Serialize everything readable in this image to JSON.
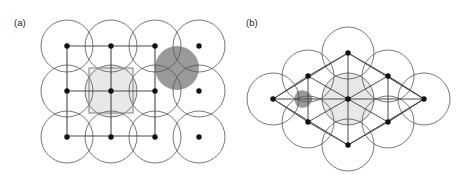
{
  "figure": {
    "width": 462,
    "height": 175,
    "background": "#ffffff"
  },
  "colors": {
    "background": "#ffffff",
    "circle_stroke": "#555555",
    "lattice_line": "#4a4a4a",
    "lattice_point": "#111111",
    "unit_cell_stroke": "#8a8a8a",
    "unit_cell_fill": "#ececec",
    "highlight_circle_fill": "#e8e8e8",
    "void_dark_fill": "#9a9a9a",
    "void_mid_fill": "#b0b0b0",
    "label_text": "#1a1a1a"
  },
  "panels": [
    {
      "id": "a",
      "label": "(a)",
      "label_x": 14,
      "label_y": 26,
      "lattice_type": "square",
      "circle_radius": 26,
      "packing_circle_radius": 26,
      "lattice_spacing_x": 44,
      "lattice_spacing_y": 45,
      "columns": 4,
      "rows": 3,
      "origin_x": 67,
      "origin_y": 46,
      "separated_column_index": 4,
      "separated_column_x": 199,
      "bond_columns": 3,
      "unit_cell": {
        "x": 89,
        "y": 68,
        "width": 44,
        "height": 45,
        "fill": "#ececec",
        "stroke": "#8a8a8a"
      },
      "highlight_circle": {
        "cx": 111,
        "cy": 91,
        "r": 26,
        "fill": "#e8e8e8"
      },
      "void": {
        "shape": "four-cusped-curved-square",
        "cx": 177,
        "cy": 68,
        "fill": "#9a9a9a"
      },
      "lattice_points": [
        {
          "x": 67,
          "y": 46
        },
        {
          "x": 111,
          "y": 46
        },
        {
          "x": 155,
          "y": 46
        },
        {
          "x": 199,
          "y": 46
        },
        {
          "x": 67,
          "y": 91
        },
        {
          "x": 111,
          "y": 91
        },
        {
          "x": 155,
          "y": 91
        },
        {
          "x": 199,
          "y": 91
        },
        {
          "x": 67,
          "y": 137
        },
        {
          "x": 111,
          "y": 137
        },
        {
          "x": 155,
          "y": 137
        },
        {
          "x": 199,
          "y": 137
        }
      ]
    },
    {
      "id": "b",
      "label": "(b)",
      "label_x": 246,
      "label_y": 26,
      "lattice_type": "triangular",
      "circle_radius": 26,
      "neighbor_distance": 46,
      "outer_distance": 75,
      "center_x": 348,
      "center_y": 99,
      "highlight_circle": {
        "cx": 348,
        "cy": 99,
        "r": 26,
        "fill": "#e8e8e8"
      },
      "void": {
        "shape": "three-cusped-curved-triangle",
        "cx": 303,
        "cy": 99,
        "fill": "#9a9a9a"
      },
      "lattice_points": [
        {
          "x": 348,
          "y": 99
        },
        {
          "x": 348,
          "y": 53
        },
        {
          "x": 348,
          "y": 145
        },
        {
          "x": 308,
          "y": 76
        },
        {
          "x": 388,
          "y": 76
        },
        {
          "x": 308,
          "y": 122
        },
        {
          "x": 388,
          "y": 122
        },
        {
          "x": 273,
          "y": 99
        },
        {
          "x": 424,
          "y": 99
        }
      ]
    }
  ]
}
